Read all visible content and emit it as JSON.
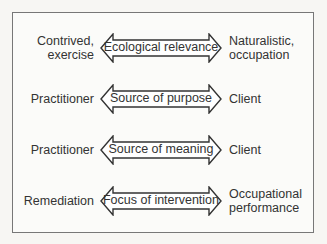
{
  "diagram": {
    "rows": [
      {
        "left": "Contrived,\nexercise",
        "label": "Ecological relevance",
        "right": "Naturalistic,\noccupation"
      },
      {
        "left": "Practitioner",
        "label": "Source of purpose",
        "right": "Client"
      },
      {
        "left": "Practitioner",
        "label": "Source of meaning",
        "right": "Client"
      },
      {
        "left": "Remediation",
        "label": "Focus of intervention",
        "right": "Occupational\nperformance"
      }
    ]
  },
  "colors": {
    "stroke": "#333333",
    "border": "#777777",
    "background": "#fbfbf9"
  }
}
